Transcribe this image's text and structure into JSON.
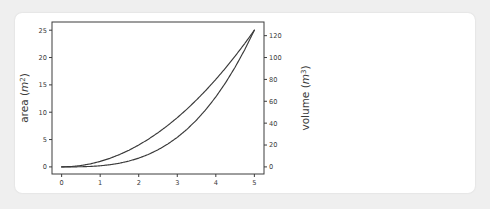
{
  "card": {
    "name": "chart-card"
  },
  "chart_data": {
    "type": "line",
    "title": "",
    "xlabel": "",
    "ylabel": "area (m^2)",
    "y2label": "volume (m^3)",
    "xlim": [
      -0.25,
      5.25
    ],
    "ylim": [
      -1.3,
      26.5
    ],
    "y2lim": [
      -6.5,
      132.5
    ],
    "grid": false,
    "legend": null,
    "x_ticks": [
      0,
      1,
      2,
      3,
      4,
      5
    ],
    "x_tick_labels": [
      "0",
      "1",
      "2",
      "3",
      "4",
      "5"
    ],
    "y_ticks": [
      0,
      5,
      10,
      15,
      20,
      25
    ],
    "y_tick_labels": [
      "0",
      "5",
      "10",
      "15",
      "20",
      "25"
    ],
    "y2_ticks": [
      0,
      20,
      40,
      60,
      80,
      100,
      120
    ],
    "y2_tick_labels": [
      "0",
      "20",
      "40",
      "60",
      "80",
      "100",
      "120"
    ],
    "line_color": "#3a3a3a",
    "x": [
      0,
      0.25,
      0.5,
      0.75,
      1,
      1.25,
      1.5,
      1.75,
      2,
      2.25,
      2.5,
      2.75,
      3,
      3.25,
      3.5,
      3.75,
      4,
      4.25,
      4.5,
      4.75,
      5
    ],
    "series": [
      {
        "name": "area",
        "axis": "left",
        "values": [
          0,
          0.0625,
          0.25,
          0.5625,
          1,
          1.5625,
          2.25,
          3.0625,
          4,
          5.0625,
          6.25,
          7.5625,
          9,
          10.5625,
          12.25,
          14.0625,
          16,
          18.0625,
          20.25,
          22.5625,
          25
        ]
      },
      {
        "name": "volume",
        "axis": "right",
        "values": [
          0,
          0.0156,
          0.125,
          0.4219,
          1,
          1.9531,
          3.375,
          5.3594,
          8,
          11.3906,
          15.625,
          20.7969,
          27,
          34.3281,
          42.875,
          52.7344,
          64,
          76.7656,
          91.125,
          107.1719,
          125
        ]
      }
    ]
  },
  "axis_labels": {
    "left_text": "area (",
    "left_unit": "m",
    "left_sup": "2",
    "left_close": ")",
    "right_text": "volume (",
    "right_unit": "m",
    "right_sup": "3",
    "right_close": ")"
  }
}
